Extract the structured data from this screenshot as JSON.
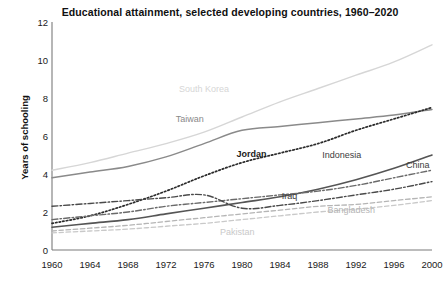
{
  "chart_data": {
    "type": "line",
    "title": "Educational attainment, selected developing countries, 1960–2020",
    "xlabel": "",
    "ylabel": "Years of schooling",
    "x": [
      1960,
      1964,
      1968,
      1972,
      1976,
      1980,
      1984,
      1988,
      1992,
      1996,
      2000
    ],
    "xticklabels": [
      "1960",
      "1964",
      "1968",
      "1972",
      "1976",
      "1980",
      "1984",
      "1988",
      "1992",
      "1996",
      "2000"
    ],
    "yticklabels": [
      "0",
      "2",
      "4",
      "6",
      "8",
      "10",
      "12"
    ],
    "ylim": [
      0,
      12
    ],
    "xlim": [
      1960,
      2000
    ],
    "ytickstep": 2,
    "grid": false,
    "legend_position": "inline-annotations",
    "series": [
      {
        "name": "South Korea",
        "label": "South Korea",
        "color": "#d6d6d6",
        "style": "solid",
        "width": 1.4,
        "label_x": 1976,
        "label_y": 8.5,
        "values": [
          4.2,
          4.6,
          5.1,
          5.6,
          6.2,
          7.0,
          7.8,
          8.5,
          9.2,
          9.9,
          10.8
        ]
      },
      {
        "name": "Taiwan",
        "label": "Taiwan",
        "color": "#8a8a8a",
        "style": "solid",
        "width": 1.5,
        "label_x": 1974.5,
        "label_y": 6.9,
        "values": [
          3.8,
          4.1,
          4.4,
          4.9,
          5.6,
          6.3,
          6.5,
          6.7,
          6.9,
          7.1,
          7.4
        ]
      },
      {
        "name": "Jordan",
        "label": "Jordan",
        "color": "#2b2b2b",
        "style": "dotted",
        "width": 1.7,
        "label_x": 1981,
        "label_y": 5.05,
        "values": [
          1.4,
          1.8,
          2.4,
          3.1,
          3.9,
          4.6,
          5.1,
          5.6,
          6.3,
          6.9,
          7.5
        ]
      },
      {
        "name": "Indonesia",
        "label": "Indonesia",
        "color": "#555555",
        "style": "solid",
        "width": 1.6,
        "label_x": 1990.5,
        "label_y": 5.0,
        "values": [
          1.2,
          1.4,
          1.6,
          1.9,
          2.2,
          2.5,
          2.8,
          3.2,
          3.7,
          4.3,
          5.0
        ]
      },
      {
        "name": "China",
        "label": "China",
        "color": "#6a6a6a",
        "style": "dashdot",
        "width": 1.4,
        "label_x": 1998.5,
        "label_y": 4.45,
        "values": [
          1.6,
          1.8,
          2.0,
          2.3,
          2.5,
          2.7,
          2.9,
          3.1,
          3.4,
          3.8,
          4.2
        ]
      },
      {
        "name": "Iraq",
        "label": "Iraq",
        "color": "#4a4a4a",
        "style": "dashdot",
        "width": 1.4,
        "label_x": 1985,
        "label_y": 2.85,
        "values": [
          2.3,
          2.45,
          2.6,
          2.75,
          2.9,
          2.2,
          2.35,
          2.6,
          2.9,
          3.2,
          3.6
        ]
      },
      {
        "name": "Bangladesh",
        "label": "Bangladesh",
        "color": "#b5b5b5",
        "style": "dashed",
        "width": 1.3,
        "label_x": 1991.5,
        "label_y": 2.1,
        "values": [
          1.0,
          1.15,
          1.3,
          1.5,
          1.7,
          1.9,
          2.1,
          2.3,
          2.4,
          2.6,
          2.8
        ]
      },
      {
        "name": "Pakistan",
        "label": "Pakistan",
        "color": "#c9c9c9",
        "style": "dashed",
        "width": 1.3,
        "label_x": 1979.5,
        "label_y": 0.95,
        "values": [
          0.9,
          1.0,
          1.1,
          1.25,
          1.4,
          1.6,
          1.8,
          2.0,
          2.15,
          2.35,
          2.6
        ]
      }
    ]
  }
}
